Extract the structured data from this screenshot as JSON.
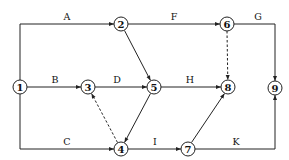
{
  "diagram": {
    "type": "activity-on-arrow network",
    "nodes": [
      {
        "id": "1",
        "label": "1",
        "x": 20,
        "y": 87
      },
      {
        "id": "2",
        "label": "2",
        "x": 121,
        "y": 24
      },
      {
        "id": "3",
        "label": "3",
        "x": 88,
        "y": 87
      },
      {
        "id": "4",
        "label": "4",
        "x": 121,
        "y": 149
      },
      {
        "id": "5",
        "label": "5",
        "x": 154,
        "y": 87
      },
      {
        "id": "6",
        "label": "6",
        "x": 227,
        "y": 24
      },
      {
        "id": "7",
        "label": "7",
        "x": 188,
        "y": 149
      },
      {
        "id": "8",
        "label": "8",
        "x": 228,
        "y": 87
      },
      {
        "id": "9",
        "label": "9",
        "x": 275,
        "y": 88
      }
    ],
    "edges": [
      {
        "label": "A",
        "from": "1",
        "to": "2",
        "dashed": false
      },
      {
        "label": "B",
        "from": "1",
        "to": "3",
        "dashed": false
      },
      {
        "label": "C",
        "from": "1",
        "to": "4",
        "dashed": false
      },
      {
        "label": "D",
        "from": "3",
        "to": "5",
        "dashed": false
      },
      {
        "label": "",
        "from": "2",
        "to": "5",
        "dashed": false
      },
      {
        "label": "",
        "from": "4",
        "to": "3",
        "dashed": true
      },
      {
        "label": "",
        "from": "5",
        "to": "4",
        "dashed": false
      },
      {
        "label": "F",
        "from": "2",
        "to": "6",
        "dashed": false
      },
      {
        "label": "G",
        "from": "6",
        "to": "9",
        "dashed": false
      },
      {
        "label": "",
        "from": "6",
        "to": "8",
        "dashed": true
      },
      {
        "label": "H",
        "from": "5",
        "to": "8",
        "dashed": false
      },
      {
        "label": "I",
        "from": "4",
        "to": "7",
        "dashed": false
      },
      {
        "label": "",
        "from": "7",
        "to": "8",
        "dashed": false
      },
      {
        "label": "K",
        "from": "7",
        "to": "9",
        "dashed": false
      }
    ],
    "edge_labels": {
      "A": "A",
      "B": "B",
      "C": "C",
      "D": "D",
      "F": "F",
      "G": "G",
      "H": "H",
      "I": "I",
      "K": "K"
    }
  }
}
